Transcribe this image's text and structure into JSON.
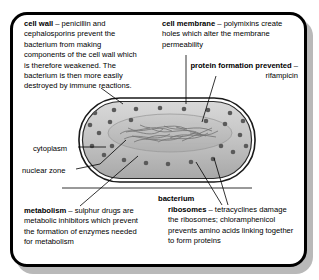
{
  "figure": {
    "frame_color": "#000000",
    "shadow_color": "#b9b9b9",
    "background": "#ffffff"
  },
  "annotations": {
    "cell_wall": {
      "term": "cell wall",
      "dash": " – ",
      "body": "penicillin and cephalosporins prevent the bacterium from making components of the cell wall which is therefore weakened. The bacterium is then more easily destroyed by immune reactions."
    },
    "cell_membrane": {
      "term": "cell membrane",
      "dash": " – ",
      "body": "polymixins create holes which alter the membrane permeability"
    },
    "protein_formation": {
      "term": "protein formation prevented",
      "dash": " – ",
      "body": "rifampicin"
    },
    "metabolism": {
      "term": "metabolism",
      "dash": " – ",
      "body": "sulphur drugs are metabolic inhibitors which prevent the formation of enzymes needed for metabolism"
    },
    "ribosomes": {
      "term": "ribosomes",
      "dash": " – ",
      "body": "tetracyclines damage the ribosomes; chloramphenicol prevents amino acids linking together to form proteins"
    },
    "cytoplasm": {
      "label": "cytoplasm"
    },
    "nuclear_zone": {
      "label": "nuclear zone"
    },
    "bacterium": {
      "label": "bacterium"
    }
  },
  "cell": {
    "shape": "rod",
    "outline_color": "#111111",
    "cytoplasm_fill": "#c8c8c8",
    "nuclear_fill": "#bdbdbd",
    "ribosome_color": "#5a5a5a",
    "ribosome_count": 26
  }
}
